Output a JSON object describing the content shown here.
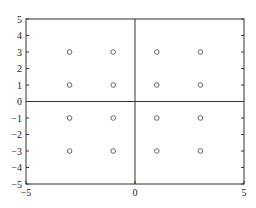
{
  "chart_data": {
    "type": "scatter",
    "title": "",
    "xlabel": "",
    "ylabel": "",
    "xlim": [
      -5,
      5
    ],
    "ylim": [
      -5,
      5
    ],
    "grid": false,
    "legend": null,
    "x_ticks": [
      -5,
      0,
      5
    ],
    "y_ticks": [
      -5,
      -4,
      -3,
      -2,
      -1,
      0,
      1,
      2,
      3,
      4,
      5
    ],
    "x_tick_labels": [
      "-5",
      "0",
      "5"
    ],
    "y_tick_labels": [
      "-5",
      "-4",
      "-3",
      "-2",
      "-1",
      "0",
      "1",
      "2",
      "3",
      "4",
      "5"
    ],
    "reference_lines": {
      "x": 0,
      "y": 0
    },
    "marker": "open-circle",
    "series": [
      {
        "name": "points",
        "x": [
          -3,
          -1,
          1,
          3,
          -3,
          -1,
          1,
          3,
          -3,
          -1,
          1,
          3,
          -3,
          -1,
          1,
          3
        ],
        "y": [
          3,
          3,
          3,
          3,
          1,
          1,
          1,
          1,
          -1,
          -1,
          -1,
          -1,
          -3,
          -3,
          -3,
          -3
        ]
      }
    ]
  },
  "colors": {
    "axis": "#333333",
    "marker": "#555555",
    "background": "#ffffff"
  }
}
